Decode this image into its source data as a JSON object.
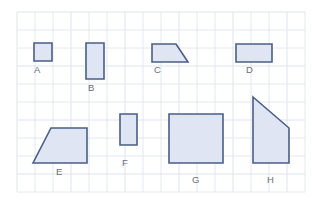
{
  "worksheet": {
    "title": "Area of shapes on a grid",
    "background_color": "#ffffff",
    "grid": {
      "cell_size": 18,
      "origin_x": 17,
      "origin_y": 12,
      "columns": 16,
      "rows": 10,
      "line_color": "#e3e8f0",
      "major_line_color": "#dde4ee",
      "visible": true
    },
    "shape_style": {
      "fill_color": "#dfe5f2",
      "stroke_color": "#4a5f86",
      "stroke_width": 1.6
    },
    "label_style": {
      "color": "#6b6f78",
      "font_size": "9.5px"
    }
  },
  "shapes": [
    {
      "id": "A",
      "label": "A",
      "type": "rectangle",
      "label_x": 34,
      "label_y": 65,
      "points": "34,43 52,43 52,61 34,61"
    },
    {
      "id": "B",
      "label": "B",
      "type": "rectangle",
      "label_x": 88,
      "label_y": 83,
      "points": "86,43 104,43 104,79 86,79"
    },
    {
      "id": "C",
      "label": "C",
      "type": "right-trapezoid",
      "label_x": 154,
      "label_y": 65,
      "points": "152,44 176,44 188,62 152,62"
    },
    {
      "id": "D",
      "label": "D",
      "type": "rectangle",
      "label_x": 246,
      "label_y": 65,
      "points": "236,44 272,44 272,62 236,62"
    },
    {
      "id": "E",
      "label": "E",
      "type": "trapezoid",
      "label_x": 56,
      "label_y": 167,
      "points": "51,128 87,128 87,163 33,163"
    },
    {
      "id": "F",
      "label": "F",
      "type": "right-trapezoid",
      "label_x": 122,
      "label_y": 158,
      "points": "120,114 137,114 137,145 120,145"
    },
    {
      "id": "G",
      "label": "G",
      "type": "square",
      "label_x": 192,
      "label_y": 175,
      "points": "169,114 223,114 223,163 169,163"
    },
    {
      "id": "H",
      "label": "H",
      "type": "right-trapezoid",
      "label_x": 267,
      "label_y": 175,
      "points": "253,97 289,128 289,163 253,163"
    }
  ]
}
